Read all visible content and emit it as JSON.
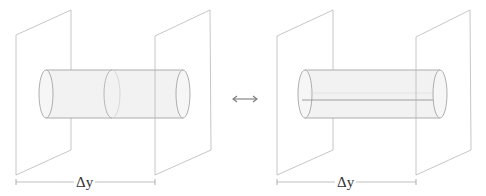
{
  "diagram": {
    "colors": {
      "plane_stroke": "#b8b8b8",
      "cylinder_fill": "#f2f2f2",
      "cylinder_stroke": "#9a9a9a",
      "text": "#333333"
    },
    "left_panel": {
      "measure_label": "Δy",
      "variant": "cylinder-with-cross-section"
    },
    "equivalence_symbol": "⟷",
    "right_panel": {
      "measure_label": "Δy",
      "variant": "cylinder-with-axis-line"
    }
  }
}
